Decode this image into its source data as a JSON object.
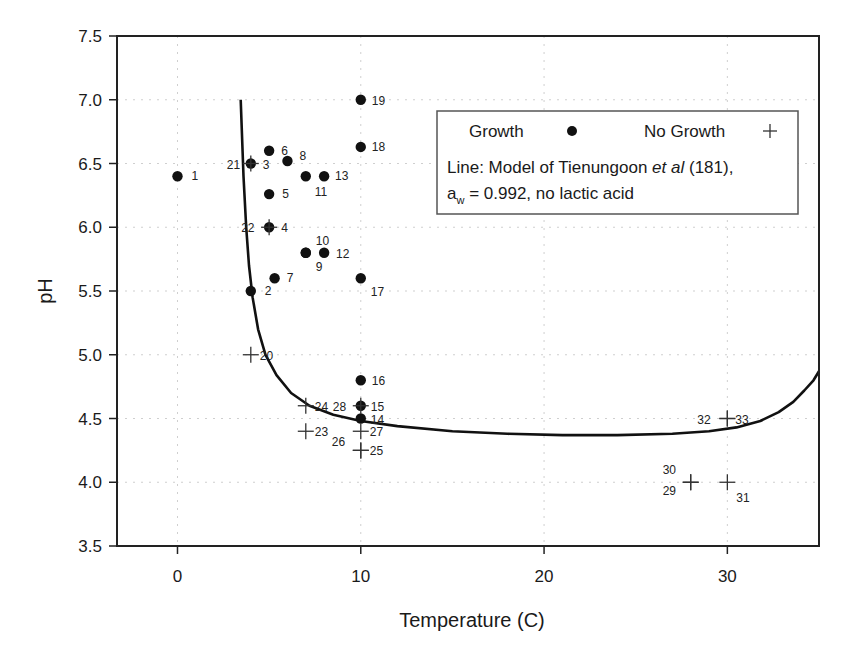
{
  "chart_data": {
    "type": "scatter",
    "title": "",
    "xlabel": "Temperature (C)",
    "ylabel": "pH",
    "xlim": [
      -3.3,
      35
    ],
    "ylim": [
      3.5,
      7.5
    ],
    "xticks": [
      0,
      10,
      20,
      30
    ],
    "yticks": [
      3.5,
      4.0,
      4.5,
      5.0,
      5.5,
      6.0,
      6.5,
      7.0,
      7.5
    ],
    "ytick_labels": [
      "3.5",
      "4.0",
      "4.5",
      "5.0",
      "5.5",
      "6.0",
      "6.5",
      "7.0",
      "7.5"
    ],
    "grid": "dotted, light",
    "legend": {
      "position": "upper right (inside)",
      "entries": [
        {
          "label": "Growth",
          "marker": "filled-circle"
        },
        {
          "label": "No Growth",
          "marker": "plus"
        }
      ],
      "line_note_prefix": "Line: Model of Tienungoon ",
      "line_note_italic": "et al",
      "line_note_suffix": " (181),",
      "line_note_2_a": "a",
      "line_note_2_sub": "w",
      "line_note_2_rest": " = 0.992, no lactic acid"
    },
    "series": [
      {
        "name": "Growth",
        "marker": "filled-circle",
        "points": [
          {
            "id": "1",
            "x": 0,
            "y": 6.4,
            "lx": 14,
            "ly": 4
          },
          {
            "id": "2",
            "x": 4,
            "y": 5.5,
            "lx": 14,
            "ly": 4
          },
          {
            "id": "3",
            "x": 4,
            "y": 6.5,
            "lx": 12,
            "ly": 5
          },
          {
            "id": "4",
            "x": 5,
            "y": 6.0,
            "lx": 12,
            "ly": 5
          },
          {
            "id": "5",
            "x": 5,
            "y": 6.26,
            "lx": 13,
            "ly": 4
          },
          {
            "id": "6",
            "x": 5,
            "y": 6.6,
            "lx": 12,
            "ly": 4
          },
          {
            "id": "7",
            "x": 5.3,
            "y": 5.6,
            "lx": 12,
            "ly": 4
          },
          {
            "id": "8",
            "x": 6,
            "y": 6.52,
            "lx": 12,
            "ly": -1
          },
          {
            "id": "9",
            "x": 7,
            "y": 5.8,
            "lx": 10,
            "ly": 18
          },
          {
            "id": "10",
            "x": 7,
            "y": 5.8,
            "lx": 10,
            "ly": -8
          },
          {
            "id": "11",
            "x": 7,
            "y": 6.4,
            "lx": 9,
            "ly": 20
          },
          {
            "id": "12",
            "x": 8,
            "y": 5.8,
            "lx": 12,
            "ly": 5
          },
          {
            "id": "13",
            "x": 8,
            "y": 6.4,
            "lx": 11,
            "ly": 4
          },
          {
            "id": "14",
            "x": 10,
            "y": 4.5,
            "lx": 10,
            "ly": 5
          },
          {
            "id": "15",
            "x": 10,
            "y": 4.6,
            "lx": 10,
            "ly": 5
          },
          {
            "id": "16",
            "x": 10,
            "y": 4.8,
            "lx": 11,
            "ly": 5
          },
          {
            "id": "17",
            "x": 10,
            "y": 5.6,
            "lx": 10,
            "ly": 18
          },
          {
            "id": "18",
            "x": 10,
            "y": 6.63,
            "lx": 11,
            "ly": 4
          },
          {
            "id": "19",
            "x": 10,
            "y": 7.0,
            "lx": 11,
            "ly": 5
          }
        ]
      },
      {
        "name": "No Growth",
        "marker": "plus",
        "points": [
          {
            "id": "20",
            "x": 4,
            "y": 5.0,
            "lx": 9,
            "ly": 5
          },
          {
            "id": "21",
            "x": 4,
            "y": 6.5,
            "lx": -24,
            "ly": 5
          },
          {
            "id": "22",
            "x": 5,
            "y": 6.0,
            "lx": -28,
            "ly": 5
          },
          {
            "id": "23",
            "x": 7,
            "y": 4.4,
            "lx": 9,
            "ly": 5
          },
          {
            "id": "24",
            "x": 7,
            "y": 4.6,
            "lx": 9,
            "ly": 5
          },
          {
            "id": "25",
            "x": 10,
            "y": 4.25,
            "lx": 9,
            "ly": 5
          },
          {
            "id": "26",
            "x": 10,
            "y": 4.25,
            "lx": -29,
            "ly": -4
          },
          {
            "id": "27",
            "x": 10,
            "y": 4.4,
            "lx": 9,
            "ly": 5
          },
          {
            "id": "28",
            "x": 10,
            "y": 4.6,
            "lx": -28,
            "ly": 5
          },
          {
            "id": "29",
            "x": 28,
            "y": 4.0,
            "lx": -28,
            "ly": 13
          },
          {
            "id": "30",
            "x": 28,
            "y": 4.0,
            "lx": -28,
            "ly": -8
          },
          {
            "id": "31",
            "x": 30,
            "y": 4.0,
            "lx": 9,
            "ly": 20
          },
          {
            "id": "32",
            "x": 30,
            "y": 4.5,
            "lx": -30,
            "ly": 5
          },
          {
            "id": "33",
            "x": 30,
            "y": 4.5,
            "lx": 8,
            "ly": 5
          }
        ]
      },
      {
        "name": "Model of Tienungoon et al (181), aw = 0.992, no lactic acid",
        "type": "line",
        "points": [
          {
            "x": 3.45,
            "y": 7.0
          },
          {
            "x": 3.6,
            "y": 6.4
          },
          {
            "x": 3.75,
            "y": 6.0
          },
          {
            "x": 3.9,
            "y": 5.7
          },
          {
            "x": 4.1,
            "y": 5.45
          },
          {
            "x": 4.4,
            "y": 5.2
          },
          {
            "x": 4.8,
            "y": 5.0
          },
          {
            "x": 5.4,
            "y": 4.84
          },
          {
            "x": 6.2,
            "y": 4.7
          },
          {
            "x": 7.2,
            "y": 4.6
          },
          {
            "x": 8.5,
            "y": 4.53
          },
          {
            "x": 10,
            "y": 4.48
          },
          {
            "x": 12,
            "y": 4.44
          },
          {
            "x": 15,
            "y": 4.4
          },
          {
            "x": 18,
            "y": 4.38
          },
          {
            "x": 21,
            "y": 4.37
          },
          {
            "x": 24,
            "y": 4.37
          },
          {
            "x": 27,
            "y": 4.38
          },
          {
            "x": 29,
            "y": 4.4
          },
          {
            "x": 30.5,
            "y": 4.43
          },
          {
            "x": 31.8,
            "y": 4.48
          },
          {
            "x": 32.8,
            "y": 4.55
          },
          {
            "x": 33.6,
            "y": 4.63
          },
          {
            "x": 34.2,
            "y": 4.72
          },
          {
            "x": 34.7,
            "y": 4.8
          },
          {
            "x": 35,
            "y": 4.87
          }
        ]
      }
    ]
  }
}
